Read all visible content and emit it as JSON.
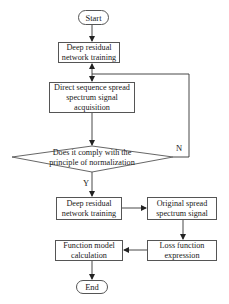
{
  "flowchart": {
    "start": "Start",
    "end": "End",
    "step1": "Deep residual network training",
    "step2": "Direct sequence spread spectrum signal acquisition",
    "decision": "Does it comply with the principle of normalization",
    "yes_label": "Y",
    "no_label": "N",
    "step3": "Deep residual network training",
    "step4": "Original spread spectrum signal",
    "step5": "Loss function expression",
    "step6": "Function model calculation"
  },
  "colors": {
    "line": "#333333",
    "box_border": "#555555",
    "background": "#ffffff"
  }
}
